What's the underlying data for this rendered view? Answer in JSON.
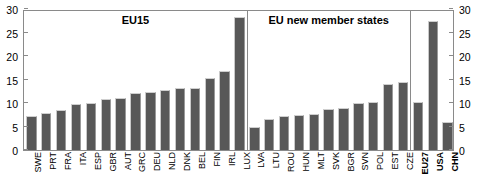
{
  "chart_data": {
    "type": "bar",
    "title": "",
    "xlabel": "",
    "ylabel": "",
    "ylim": [
      0,
      30
    ],
    "yticks": [
      0,
      5,
      10,
      15,
      20,
      25,
      30
    ],
    "left_axis_ticks": [
      "0",
      "5",
      "10",
      "15",
      "20",
      "25",
      "30"
    ],
    "right_axis_ticks": [
      "0",
      "5",
      "10",
      "15",
      "20",
      "25",
      "30"
    ],
    "grid": false,
    "legend": "none",
    "categories": [
      "SWE",
      "PRT",
      "FRA",
      "ITA",
      "ESP",
      "GBR",
      "AUT",
      "GRC",
      "DEU",
      "NLD",
      "DNK",
      "BEL",
      "FIN",
      "IRL",
      "LUX",
      "LVA",
      "LTU",
      "ROU",
      "HUN",
      "MLT",
      "SVK",
      "BGR",
      "SVN",
      "POL",
      "EST",
      "CZE",
      "EU27",
      "USA",
      "CHN"
    ],
    "values": [
      7.2,
      7.9,
      8.6,
      9.7,
      9.9,
      10.8,
      11.0,
      12.1,
      12.3,
      12.8,
      13.1,
      13.1,
      15.4,
      16.8,
      28.4,
      5.0,
      6.6,
      7.2,
      7.4,
      7.6,
      8.8,
      9.0,
      10.1,
      10.3,
      14.1,
      14.5,
      10.3,
      27.5,
      6.0
    ],
    "bold_categories": [
      "EU27",
      "USA",
      "CHN"
    ],
    "groups": [
      {
        "id": "eu15",
        "label": "EU15",
        "start_index": 0,
        "end_index": 14
      },
      {
        "id": "eu-new",
        "label": "EU new member states",
        "start_index": 15,
        "end_index": 25
      },
      {
        "id": "reference",
        "label": "",
        "start_index": 26,
        "end_index": 28
      }
    ],
    "dividers_after_index": [
      14,
      25
    ],
    "bar_color": "#585858",
    "axis_color": "#8a8a8a"
  }
}
